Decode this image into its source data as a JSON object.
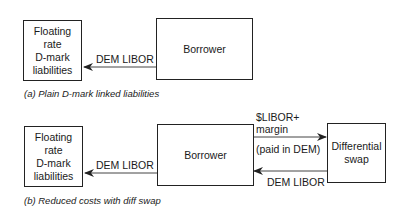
{
  "panel_a": {
    "liabilities_box": [
      "Floating",
      "rate",
      "D-mark",
      "liabilities"
    ],
    "borrower_box": "Borrower",
    "arrow_label": "DEM LIBOR",
    "caption": "(a) Plain D-mark linked liabilities"
  },
  "panel_b": {
    "liabilities_box": [
      "Floating",
      "rate",
      "D-mark",
      "liabilities"
    ],
    "borrower_box": "Borrower",
    "swap_box": [
      "Differential",
      "swap"
    ],
    "arrow_left_label": "DEM LIBOR",
    "arrow_to_swap_label": [
      "$LIBOR+",
      "margin"
    ],
    "arrow_to_swap_note": "(paid in DEM)",
    "arrow_from_swap_label": "DEM LIBOR",
    "caption": "(b) Reduced costs with diff swap"
  }
}
